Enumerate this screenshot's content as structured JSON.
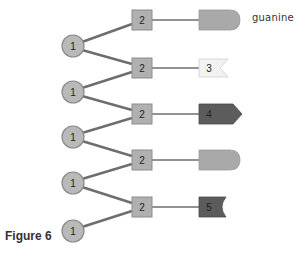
{
  "figure": {
    "caption": "Figure 6",
    "base_label": "guanine"
  },
  "colors": {
    "link": "#6e6e6e",
    "circle_fill": "#b9b9b9",
    "circle_stroke": "#8a8a8a",
    "square_fill": "#b0b0b0",
    "square_stroke": "#8c8c8c",
    "base_mid": "#a9a9a9",
    "base_light": "#f2f2f2",
    "base_dark": "#5c5c5c"
  },
  "sugars": [
    {
      "label": "1"
    },
    {
      "label": "1"
    },
    {
      "label": "1"
    },
    {
      "label": "1"
    },
    {
      "label": "1"
    }
  ],
  "phosphates_or_units": [
    {
      "label": "2"
    },
    {
      "label": "2"
    },
    {
      "label": "2"
    },
    {
      "label": "2"
    },
    {
      "label": "2"
    }
  ],
  "bases": [
    {
      "label": "",
      "shape": "rounded",
      "tone": "mid",
      "name": "guanine"
    },
    {
      "label": "3",
      "shape": "notched",
      "tone": "light"
    },
    {
      "label": "4",
      "shape": "pointed",
      "tone": "dark"
    },
    {
      "label": "",
      "shape": "rounded",
      "tone": "mid"
    },
    {
      "label": "5",
      "shape": "concave",
      "tone": "dark"
    }
  ]
}
